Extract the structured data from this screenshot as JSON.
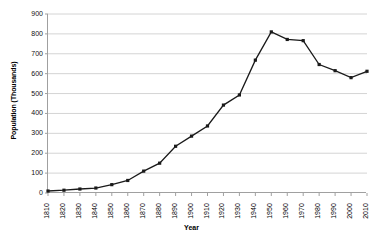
{
  "chart_data": {
    "type": "line",
    "title": "",
    "xlabel": "Year",
    "ylabel": "Population (Thousands)",
    "xlim": [
      1810,
      2010
    ],
    "ylim": [
      0,
      900
    ],
    "ytick_step": 100,
    "grid": true,
    "legend": false,
    "marker": "square",
    "line_color": "#1a1a1a",
    "grid_color": "#d4d4d4",
    "axis_color": "#a0a0a0",
    "categories": [
      1810,
      1820,
      1830,
      1840,
      1850,
      1860,
      1870,
      1880,
      1890,
      1900,
      1910,
      1920,
      1930,
      1940,
      1950,
      1960,
      1970,
      1980,
      1990,
      2000,
      2010
    ],
    "values": [
      10,
      14,
      20,
      25,
      42,
      63,
      110,
      150,
      235,
      286,
      337,
      442,
      493,
      668,
      810,
      772,
      766,
      646,
      615,
      580,
      612
    ],
    "ytick_labels": [
      "900",
      "800",
      "700",
      "600",
      "500",
      "400",
      "300",
      "200",
      "100",
      "0"
    ],
    "xtick_labels": [
      "1810",
      "1820",
      "1830",
      "1840",
      "1850",
      "1860",
      "1870",
      "1880",
      "1890",
      "1900",
      "1910",
      "1920",
      "1930",
      "1940",
      "1950",
      "1960",
      "1970",
      "1980",
      "1990",
      "2000",
      "2010"
    ]
  }
}
